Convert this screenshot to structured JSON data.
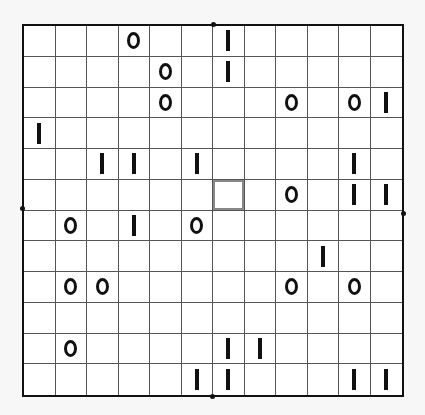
{
  "puzzle": {
    "type": "binary-puzzle",
    "rows": 12,
    "cols": 12,
    "selected_cell": {
      "row": 5,
      "col": 6
    },
    "grid": [
      [
        "",
        "",
        "",
        "0",
        "",
        "",
        "1",
        "",
        "",
        "",
        "",
        ""
      ],
      [
        "",
        "",
        "",
        "",
        "0",
        "",
        "1",
        "",
        "",
        "",
        "",
        ""
      ],
      [
        "",
        "",
        "",
        "",
        "0",
        "",
        "",
        "",
        "0",
        "",
        "0",
        "1"
      ],
      [
        "1",
        "",
        "",
        "",
        "",
        "",
        "",
        "",
        "",
        "",
        "",
        ""
      ],
      [
        "",
        "",
        "1",
        "1",
        "",
        "1",
        "",
        "",
        "",
        "",
        "1",
        ""
      ],
      [
        "",
        "",
        "",
        "",
        "",
        "",
        "",
        "",
        "0",
        "",
        "1",
        "1"
      ],
      [
        "",
        "0",
        "",
        "1",
        "",
        "0",
        "",
        "",
        "",
        "",
        "",
        ""
      ],
      [
        "",
        "",
        "",
        "",
        "",
        "",
        "",
        "",
        "",
        "1",
        "",
        ""
      ],
      [
        "",
        "0",
        "0",
        "",
        "",
        "",
        "",
        "",
        "0",
        "",
        "0",
        ""
      ],
      [
        "",
        "",
        "",
        "",
        "",
        "",
        "",
        "",
        "",
        "",
        "",
        ""
      ],
      [
        "",
        "0",
        "",
        "",
        "",
        "",
        "1",
        "1",
        "",
        "",
        "",
        ""
      ],
      [
        "",
        "",
        "",
        "",
        "",
        "1",
        "1",
        "",
        "",
        "",
        "1",
        "1"
      ]
    ]
  },
  "colors": {
    "background": "#f7f7f7",
    "grid_line": "#555555",
    "border": "#111111",
    "symbol": "#111111",
    "selection": "#888888"
  }
}
